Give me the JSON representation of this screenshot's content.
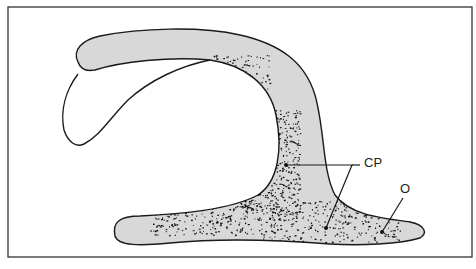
{
  "diagram": {
    "colors": {
      "frame": "#333333",
      "fill": "#d8d8d8",
      "outline": "#1a1a1a",
      "stipple": "#111111",
      "background": "#ffffff"
    },
    "labels": {
      "cp": "CP",
      "o": "O"
    }
  }
}
